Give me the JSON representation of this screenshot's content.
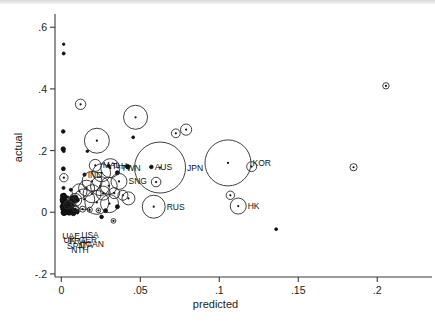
{
  "chart_data": {
    "type": "scatter",
    "title": "",
    "xlabel": "predicted",
    "ylabel": "actual",
    "xlim": [
      -0.004,
      0.222
    ],
    "ylim": [
      -0.21,
      0.63
    ],
    "xticks": [
      0,
      0.05,
      0.1,
      0.15,
      0.2
    ],
    "xticklabels": [
      "0",
      ".05",
      ".1",
      ".15",
      ".2"
    ],
    "yticks": [
      -0.2,
      0,
      0.2,
      0.4,
      0.6
    ],
    "yticklabels": [
      "-.2",
      "0",
      ".2",
      ".4",
      ".6"
    ],
    "grid": false,
    "legend": null,
    "marker": "bubble-open-circle-with-center-dot",
    "note": "Bubble size encodes a third weight variable; r is marker radius in pixels.",
    "points": [
      {
        "x": 0.0015,
        "y": 0.545,
        "r": 1.2,
        "label": ""
      },
      {
        "x": 0.0015,
        "y": 0.515,
        "r": 1.5,
        "label": ""
      },
      {
        "x": 0.0012,
        "y": 0.262,
        "r": 1.8,
        "label": ""
      },
      {
        "x": 0.0012,
        "y": 0.205,
        "r": 2.2,
        "label": ""
      },
      {
        "x": 0.0015,
        "y": 0.198,
        "r": 1.4,
        "label": ""
      },
      {
        "x": 0.0013,
        "y": 0.141,
        "r": 1.9,
        "label": ""
      },
      {
        "x": 0.0016,
        "y": 0.112,
        "r": 4.2,
        "label": ""
      },
      {
        "x": 0.0014,
        "y": 0.079,
        "r": 1.5,
        "label": ""
      },
      {
        "x": 0.006,
        "y": 0.073,
        "r": 1.5,
        "label": ""
      },
      {
        "x": 0.0016,
        "y": 0.055,
        "r": 1.7,
        "label": ""
      },
      {
        "x": 0.007,
        "y": 0.05,
        "r": 1.4,
        "label": ""
      },
      {
        "x": 0.0122,
        "y": 0.35,
        "r": 5.2,
        "label": ""
      },
      {
        "x": 0.0225,
        "y": 0.232,
        "r": 12.5,
        "label": ""
      },
      {
        "x": 0.0165,
        "y": 0.198,
        "r": 1.3,
        "label": ""
      },
      {
        "x": 0.047,
        "y": 0.308,
        "r": 12.0,
        "label": ""
      },
      {
        "x": 0.0455,
        "y": 0.243,
        "r": 1.4,
        "label": ""
      },
      {
        "x": 0.0725,
        "y": 0.256,
        "r": 4.4,
        "label": ""
      },
      {
        "x": 0.079,
        "y": 0.268,
        "r": 5.6,
        "label": ""
      },
      {
        "x": 0.0215,
        "y": 0.152,
        "r": 6.0,
        "label": "MAL"
      },
      {
        "x": 0.03,
        "y": 0.15,
        "r": 1.6,
        "label": "THA"
      },
      {
        "x": 0.031,
        "y": 0.143,
        "r": 9.5,
        "label": "TWN"
      },
      {
        "x": 0.0147,
        "y": 0.122,
        "r": 1.6,
        "label": "IND"
      },
      {
        "x": 0.0255,
        "y": 0.128,
        "r": 9.0,
        "label": ""
      },
      {
        "x": 0.0355,
        "y": 0.128,
        "r": 2.0,
        "label": ""
      },
      {
        "x": 0.042,
        "y": 0.148,
        "r": 2.2,
        "label": ""
      },
      {
        "x": 0.0365,
        "y": 0.1,
        "r": 8.0,
        "label": "SNG"
      },
      {
        "x": 0.057,
        "y": 0.147,
        "r": 1.8,
        "label": "AUS"
      },
      {
        "x": 0.0625,
        "y": 0.145,
        "r": 25.5,
        "label": "JPN"
      },
      {
        "x": 0.06,
        "y": 0.098,
        "r": 4.8,
        "label": ""
      },
      {
        "x": 0.1055,
        "y": 0.16,
        "r": 23.0,
        "label": "KOR"
      },
      {
        "x": 0.1205,
        "y": 0.148,
        "r": 5.0,
        "label": ""
      },
      {
        "x": 0.185,
        "y": 0.146,
        "r": 3.6,
        "label": ""
      },
      {
        "x": 0.2055,
        "y": 0.41,
        "r": 3.2,
        "label": ""
      },
      {
        "x": 0.107,
        "y": 0.055,
        "r": 4.2,
        "label": ""
      },
      {
        "x": 0.112,
        "y": 0.02,
        "r": 8.0,
        "label": "HK"
      },
      {
        "x": 0.0585,
        "y": 0.018,
        "r": 11.5,
        "label": "RUS"
      },
      {
        "x": 0.0195,
        "y": 0.1,
        "r": 10.0,
        "label": ""
      },
      {
        "x": 0.0245,
        "y": 0.085,
        "r": 9.5,
        "label": ""
      },
      {
        "x": 0.03,
        "y": 0.086,
        "r": 8.5,
        "label": ""
      },
      {
        "x": 0.016,
        "y": 0.078,
        "r": 8.0,
        "label": ""
      },
      {
        "x": 0.0115,
        "y": 0.068,
        "r": 7.5,
        "label": ""
      },
      {
        "x": 0.0195,
        "y": 0.06,
        "r": 9.0,
        "label": ""
      },
      {
        "x": 0.0265,
        "y": 0.062,
        "r": 7.0,
        "label": ""
      },
      {
        "x": 0.0335,
        "y": 0.062,
        "r": 5.5,
        "label": ""
      },
      {
        "x": 0.039,
        "y": 0.055,
        "r": 5.0,
        "label": ""
      },
      {
        "x": 0.0425,
        "y": 0.045,
        "r": 6.5,
        "label": ""
      },
      {
        "x": 0.0145,
        "y": 0.042,
        "r": 10.5,
        "label": ""
      },
      {
        "x": 0.0225,
        "y": 0.032,
        "r": 12.0,
        "label": ""
      },
      {
        "x": 0.0305,
        "y": 0.028,
        "r": 9.0,
        "label": ""
      },
      {
        "x": 0.0088,
        "y": 0.04,
        "r": 6.5,
        "label": ""
      },
      {
        "x": 0.0062,
        "y": 0.03,
        "r": 5.0,
        "label": ""
      },
      {
        "x": 0.004,
        "y": 0.024,
        "r": 4.0,
        "label": ""
      },
      {
        "x": 0.0355,
        "y": 0.018,
        "r": 2.0,
        "label": ""
      },
      {
        "x": 0.009,
        "y": 0.012,
        "r": 3.2,
        "label": ""
      },
      {
        "x": 0.0135,
        "y": 0.01,
        "r": 3.0,
        "label": ""
      },
      {
        "x": 0.018,
        "y": 0.008,
        "r": 2.6,
        "label": ""
      },
      {
        "x": 0.0235,
        "y": 0.006,
        "r": 2.4,
        "label": ""
      },
      {
        "x": 0.028,
        "y": 0.005,
        "r": 2.0,
        "label": ""
      },
      {
        "x": 0.136,
        "y": -0.055,
        "r": 1.4,
        "label": ""
      },
      {
        "x": 0.033,
        "y": -0.028,
        "r": 2.4,
        "label": ""
      },
      {
        "x": 0.0255,
        "y": -0.015,
        "r": 1.8,
        "label": ""
      }
    ],
    "dense_cluster": {
      "description": "Dense overlapping mass of small filled markers near the origin",
      "x_range": [
        0.0005,
        0.012
      ],
      "y_range": [
        -0.005,
        0.055
      ],
      "count": 62
    },
    "point_labels": [
      "UAE",
      "USA",
      "UK",
      "FRA",
      "GER",
      "SPN",
      "ITA",
      "CAN",
      "NTH",
      "IND",
      "MAL",
      "THA",
      "TWN",
      "SNG",
      "AUS",
      "JPN",
      "RUS",
      "KOR",
      "HK"
    ],
    "corner_labels": [
      {
        "text": "UAE",
        "x": 0.0062,
        "y": -0.087
      },
      {
        "text": "USA",
        "x": 0.0182,
        "y": -0.082
      },
      {
        "text": "UK",
        "x": 0.0052,
        "y": -0.1
      },
      {
        "text": "FRA",
        "x": 0.0102,
        "y": -0.103
      },
      {
        "text": "GER",
        "x": 0.0168,
        "y": -0.1
      },
      {
        "text": "SPN",
        "x": 0.0092,
        "y": -0.118
      },
      {
        "text": "ITA",
        "x": 0.0158,
        "y": -0.116
      },
      {
        "text": "CAN",
        "x": 0.0212,
        "y": -0.113
      },
      {
        "text": "NTH",
        "x": 0.0118,
        "y": -0.133
      }
    ]
  }
}
